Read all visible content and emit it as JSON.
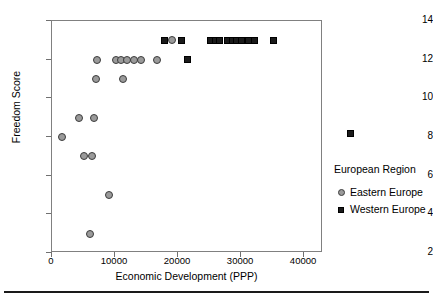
{
  "chart_data": {
    "type": "scatter",
    "title": "",
    "xlabel": "Economic Development (PPP)",
    "ylabel": "Freedom Score",
    "xlim": [
      0,
      43000
    ],
    "ylim": [
      2,
      14
    ],
    "xticks": [
      0,
      10000,
      20000,
      30000,
      40000
    ],
    "xtick_labels": [
      "0",
      "10000",
      "20000",
      "30000",
      "40000"
    ],
    "yticks": [
      2,
      4,
      6,
      8,
      10,
      12,
      14
    ],
    "ytick_labels": [
      "2",
      "4",
      "6",
      "8",
      "10",
      "12",
      "14"
    ],
    "grid": false,
    "legend_position": "right",
    "legend_title": "European Region",
    "series": [
      {
        "name": "Eastern Europe",
        "marker": "circle",
        "color": "#9a9a9a",
        "edge_color": "#3c3c3c",
        "points": [
          {
            "x": 1600,
            "y": 8
          },
          {
            "x": 4300,
            "y": 9
          },
          {
            "x": 6600,
            "y": 9
          },
          {
            "x": 5100,
            "y": 7
          },
          {
            "x": 6300,
            "y": 7
          },
          {
            "x": 6000,
            "y": 3
          },
          {
            "x": 9000,
            "y": 5
          },
          {
            "x": 7000,
            "y": 11
          },
          {
            "x": 11200,
            "y": 11
          },
          {
            "x": 7100,
            "y": 12
          },
          {
            "x": 10200,
            "y": 12
          },
          {
            "x": 11000,
            "y": 12
          },
          {
            "x": 11900,
            "y": 12
          },
          {
            "x": 13000,
            "y": 12
          },
          {
            "x": 14200,
            "y": 12
          },
          {
            "x": 16600,
            "y": 12
          },
          {
            "x": 19000,
            "y": 13
          }
        ]
      },
      {
        "name": "Western Europe",
        "marker": "square",
        "color": "#1a1a1a",
        "edge_color": "#000000",
        "points": [
          {
            "x": 21500,
            "y": 12
          },
          {
            "x": 17800,
            "y": 13
          },
          {
            "x": 20500,
            "y": 13
          },
          {
            "x": 25200,
            "y": 13
          },
          {
            "x": 25900,
            "y": 13
          },
          {
            "x": 26600,
            "y": 13
          },
          {
            "x": 27900,
            "y": 13
          },
          {
            "x": 28600,
            "y": 13
          },
          {
            "x": 29300,
            "y": 13
          },
          {
            "x": 30000,
            "y": 13
          },
          {
            "x": 31100,
            "y": 13
          },
          {
            "x": 32100,
            "y": 13
          },
          {
            "x": 35200,
            "y": 13
          },
          {
            "x": 47400,
            "y": 8.2
          }
        ]
      }
    ]
  },
  "legend": {
    "title": "European Region",
    "entries": [
      {
        "label": "Eastern Europe",
        "marker": "circle"
      },
      {
        "label": "Western Europe",
        "marker": "square"
      }
    ]
  },
  "axes": {
    "x_title": "Economic Development (PPP)",
    "y_title": "Freedom Score"
  }
}
